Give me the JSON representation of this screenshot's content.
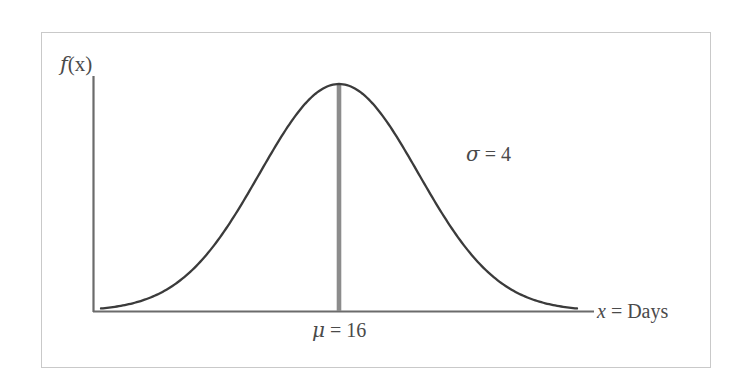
{
  "figure": {
    "background_color": "#ffffff",
    "frame_color": "#c9c9c9",
    "curve_color": "#3b3b3b",
    "axis_color": "#6b6b6b",
    "mean_line_color": "#8c8c8c",
    "text_color": "#4a4a4a"
  },
  "labels": {
    "y_axis": "f(x)",
    "y_axis_var": "f",
    "y_axis_arg": "(x)",
    "x_axis": "x = Days",
    "x_axis_var": "x",
    "x_axis_rest": " = Days",
    "mean": "μ = 16",
    "mean_symbol": "μ",
    "mean_rest": " = 16",
    "sigma": "σ = 4",
    "sigma_symbol": "σ",
    "sigma_rest": " = 4"
  },
  "chart_data": {
    "type": "line",
    "title": "",
    "subtitle": "",
    "xlabel": "x = Days",
    "ylabel": "f(x)",
    "distribution": "normal",
    "mean": 16,
    "std_dev": 4,
    "annotations": [
      {
        "text": "μ = 16",
        "role": "mean-marker-label",
        "x": 16,
        "position": "below-axis"
      },
      {
        "text": "σ = 4",
        "role": "std-dev-label",
        "x": 24.5,
        "position": "upper-right-of-curve"
      }
    ],
    "vertical_line_at_mean": true,
    "grid": false,
    "legend": null,
    "xlim": [
      4,
      28
    ],
    "ylim": [
      0,
      0.105
    ],
    "x": [
      4,
      5,
      6,
      7,
      8,
      9,
      10,
      11,
      12,
      13,
      14,
      15,
      16,
      17,
      18,
      19,
      20,
      21,
      22,
      23,
      24,
      25,
      26,
      27,
      28
    ],
    "y": [
      0.0002,
      0.0009,
      0.0022,
      0.0046,
      0.0088,
      0.0151,
      0.0228,
      0.0323,
      0.043,
      0.0539,
      0.0639,
      0.0705,
      0.0997,
      0.0705,
      0.0639,
      0.0539,
      0.043,
      0.0323,
      0.0228,
      0.0151,
      0.0088,
      0.0046,
      0.0022,
      0.0009,
      0.0002
    ],
    "curve_formula": "f(x) = (1/(4*sqrt(2*pi))) * exp(-((x-16)^2)/(2*4^2))",
    "x_tick_labels": [],
    "y_tick_labels": []
  }
}
